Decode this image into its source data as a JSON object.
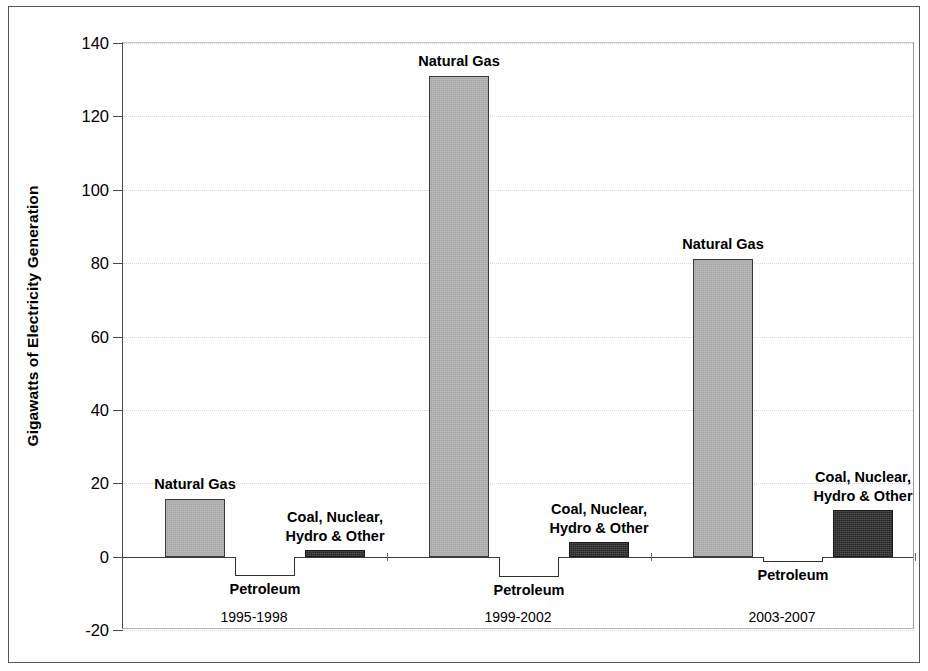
{
  "chart_data": {
    "type": "bar",
    "title": "",
    "subtitle": "",
    "xlabel": "",
    "ylabel": "Gigawatts of Electricity Generation",
    "ylim": [
      -20,
      140
    ],
    "ytick_labels": [
      "140",
      "120",
      "100",
      "80",
      "60",
      "40",
      "20",
      "0",
      "-20"
    ],
    "ytick_values": [
      140,
      120,
      100,
      80,
      60,
      40,
      20,
      0,
      -20
    ],
    "grid": true,
    "legend_position": "none",
    "categories": [
      "1995-1998",
      "1999-2002",
      "2003-2007"
    ],
    "series": [
      {
        "name": "Natural Gas",
        "values": [
          15.7,
          131.0,
          81.0
        ]
      },
      {
        "name": "Petroleum",
        "values": [
          -5.2,
          -5.5,
          -1.5
        ]
      },
      {
        "name": "Coal, Nuclear,\nHydro & Other",
        "values": [
          1.7,
          3.9,
          12.7
        ]
      }
    ],
    "colors": {
      "natural_gas": "#b2b2b2",
      "petroleum": "#ffffff",
      "coal_nuclear_hydro_other": "#2b2b2b",
      "axis": "#3b3b3b",
      "grid": "#d8d8d8"
    },
    "annotations": [
      {
        "text": "Natural Gas",
        "group": "1995-1998",
        "series": "Natural Gas"
      },
      {
        "text": "Petroleum",
        "group": "1995-1998",
        "series": "Petroleum"
      },
      {
        "text": "Coal, Nuclear,\nHydro & Other",
        "group": "1995-1998",
        "series": "Coal, Nuclear, Hydro & Other"
      },
      {
        "text": "Natural Gas",
        "group": "1999-2002",
        "series": "Natural Gas"
      },
      {
        "text": "Petroleum",
        "group": "1999-2002",
        "series": "Petroleum"
      },
      {
        "text": "Coal, Nuclear,\nHydro & Other",
        "group": "1999-2002",
        "series": "Coal, Nuclear, Hydro & Other"
      },
      {
        "text": "Natural Gas",
        "group": "2003-2007",
        "series": "Natural Gas"
      },
      {
        "text": "Petroleum",
        "group": "2003-2007",
        "series": "Petroleum"
      },
      {
        "text": "Coal, Nuclear,\nHydro & Other",
        "group": "2003-2007",
        "series": "Coal, Nuclear, Hydro & Other"
      }
    ]
  },
  "axis": {
    "y_title": "Gigawatts of Electricity Generation",
    "ticks": [
      "140",
      "120",
      "100",
      "80",
      "60",
      "40",
      "20",
      "0",
      "-20"
    ]
  },
  "groups": [
    {
      "label": "1995-1998",
      "bars": [
        {
          "series": "Natural Gas",
          "label": "Natural Gas",
          "value": 15.7
        },
        {
          "series": "Petroleum",
          "label": "Petroleum",
          "value": -5.2
        },
        {
          "series": "Coal, Nuclear, Hydro & Other",
          "label": "Coal, Nuclear,\nHydro & Other",
          "value": 1.7
        }
      ]
    },
    {
      "label": "1999-2002",
      "bars": [
        {
          "series": "Natural Gas",
          "label": "Natural Gas",
          "value": 131.0
        },
        {
          "series": "Petroleum",
          "label": "Petroleum",
          "value": -5.5
        },
        {
          "series": "Coal, Nuclear, Hydro & Other",
          "label": "Coal, Nuclear,\nHydro & Other",
          "value": 3.9
        }
      ]
    },
    {
      "label": "2003-2007",
      "bars": [
        {
          "series": "Natural Gas",
          "label": "Natural Gas",
          "value": 81.0
        },
        {
          "series": "Petroleum",
          "label": "Petroleum",
          "value": -1.5
        },
        {
          "series": "Coal, Nuclear, Hydro & Other",
          "label": "Coal, Nuclear,\nHydro & Other",
          "value": 12.7
        }
      ]
    }
  ]
}
